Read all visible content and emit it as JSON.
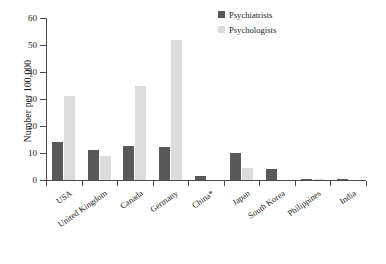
{
  "chart_data": {
    "type": "bar",
    "title": "",
    "xlabel": "",
    "ylabel": "Number per 100,000",
    "ylim": [
      0,
      60
    ],
    "yticks": [
      0,
      10,
      20,
      30,
      40,
      50,
      60
    ],
    "grid": false,
    "legend_position": "top-right",
    "categories": [
      "USA",
      "United Kingdom",
      "Canada",
      "Germany",
      "China*",
      "Japan",
      "South Korea",
      "Philippines",
      "India"
    ],
    "series": [
      {
        "name": "Psychiatrists",
        "color": "#595959",
        "values": [
          14,
          11,
          12.5,
          12.3,
          1.5,
          10,
          4,
          0.5,
          0.2
        ]
      },
      {
        "name": "Psychologists",
        "color": "#dcdcdc",
        "values": [
          31,
          9,
          35,
          52,
          0,
          4.3,
          0,
          0.3,
          0
        ]
      }
    ]
  },
  "axis": {
    "y_title": "Number per 100,000",
    "y_tick_labels": [
      "0",
      "10",
      "20",
      "30",
      "40",
      "50",
      "60"
    ]
  },
  "legend": {
    "items": [
      {
        "label": "Psychiatrists"
      },
      {
        "label": "Psychologists"
      }
    ]
  }
}
